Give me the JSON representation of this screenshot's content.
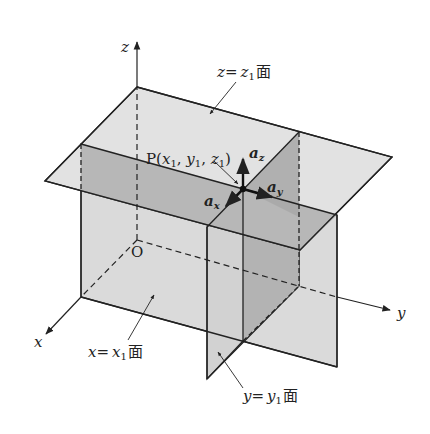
{
  "figure": {
    "axes": {
      "x_label": "x",
      "y_label": "y",
      "z_label": "z",
      "origin_label": "O"
    },
    "planes": {
      "z_plane": {
        "label_var": "z",
        "label_eq": "=",
        "label_val": "z",
        "label_sub": "1",
        "label_suffix": "面"
      },
      "x_plane": {
        "label_var": "x",
        "label_eq": "=",
        "label_val": "x",
        "label_sub": "1",
        "label_suffix": "面"
      },
      "y_plane": {
        "label_var": "y",
        "label_eq": "=",
        "label_val": "y",
        "label_sub": "1",
        "label_suffix": "面"
      }
    },
    "point": {
      "name": "P",
      "open": "(",
      "x": "x",
      "x_sub": "1",
      "comma1": ", ",
      "y": "y",
      "y_sub": "1",
      "comma2": ", ",
      "z": "z",
      "z_sub": "1",
      "close": ")"
    },
    "unit_vectors": {
      "ax": {
        "base": "a",
        "sub": "x"
      },
      "ay": {
        "base": "a",
        "sub": "y"
      },
      "az": {
        "base": "a",
        "sub": "z"
      }
    },
    "colors": {
      "plane_light": "#dcdcdc",
      "plane_mid": "#c8c8c8",
      "plane_dark": "#a9a9a9",
      "line": "#222222"
    }
  }
}
